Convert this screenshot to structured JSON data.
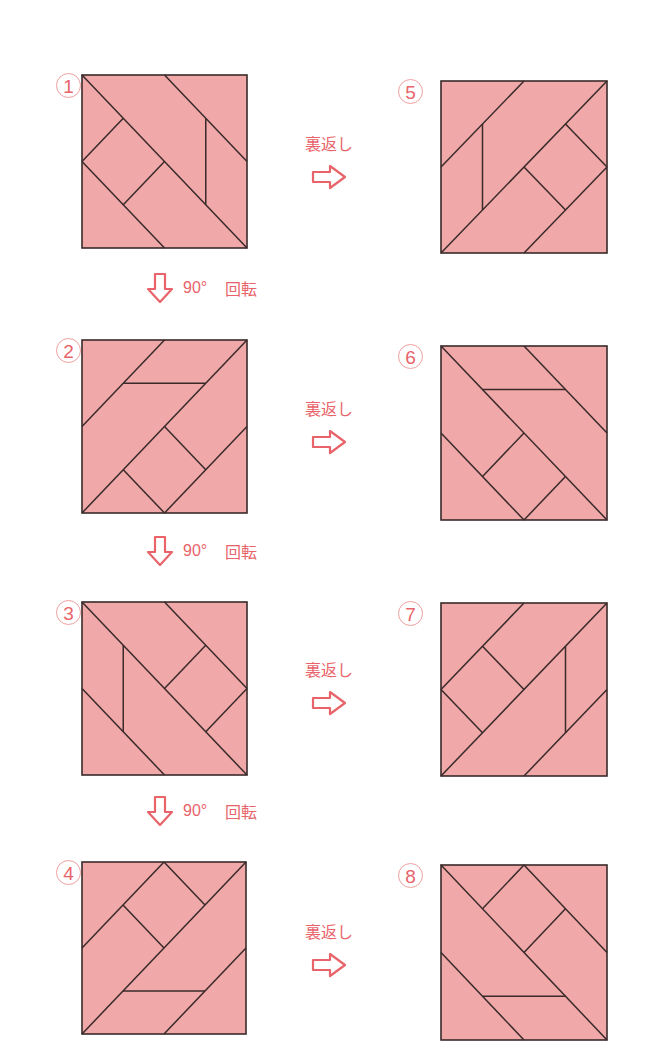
{
  "style": {
    "fill": "#f0a8a8",
    "stroke": "#3a2a2a",
    "accent": "#e8646a",
    "badge_border": "#f0a0a0"
  },
  "panels": [
    {
      "id": 1,
      "label": "1",
      "x": 82,
      "y": 75,
      "w": 165,
      "h": 173,
      "lines": [
        [
          0,
          0,
          1,
          1
        ],
        [
          0.5,
          0,
          1,
          0.5
        ],
        [
          0,
          0.5,
          0.5,
          1
        ],
        [
          0,
          0.5,
          0.25,
          0.25
        ],
        [
          0.25,
          0.75,
          0.5,
          0.5
        ],
        [
          0.75,
          0.25,
          0.75,
          0.75
        ]
      ]
    },
    {
      "id": 2,
      "label": "2",
      "x": 82,
      "y": 340,
      "w": 165,
      "h": 173,
      "lines": [
        [
          0,
          1,
          1,
          0
        ],
        [
          0,
          0.5,
          0.5,
          0
        ],
        [
          0.5,
          1,
          1,
          0.5
        ],
        [
          0.25,
          0.25,
          0.75,
          0.25
        ],
        [
          0.25,
          0.75,
          0.5,
          1
        ],
        [
          0.5,
          0.5,
          0.75,
          0.75
        ]
      ]
    },
    {
      "id": 3,
      "label": "3",
      "x": 82,
      "y": 602,
      "w": 165,
      "h": 173,
      "lines": [
        [
          0,
          0,
          1,
          1
        ],
        [
          0.5,
          0,
          1,
          0.5
        ],
        [
          0,
          0.5,
          0.5,
          1
        ],
        [
          0.75,
          0.25,
          0.5,
          0.5
        ],
        [
          1,
          0.5,
          0.75,
          0.75
        ],
        [
          0.25,
          0.25,
          0.25,
          0.75
        ]
      ]
    },
    {
      "id": 4,
      "label": "4",
      "x": 82,
      "y": 862,
      "w": 164,
      "h": 172,
      "lines": [
        [
          0,
          1,
          1,
          0
        ],
        [
          0,
          0.5,
          0.5,
          0
        ],
        [
          0.5,
          1,
          1,
          0.5
        ],
        [
          0.25,
          0.25,
          0.5,
          0.5
        ],
        [
          0.5,
          0,
          0.75,
          0.25
        ],
        [
          0.25,
          0.75,
          0.75,
          0.75
        ]
      ]
    },
    {
      "id": 5,
      "label": "5",
      "x": 441,
      "y": 81,
      "w": 166,
      "h": 172,
      "lines": [
        [
          0,
          1,
          1,
          0
        ],
        [
          0,
          0.5,
          0.5,
          0
        ],
        [
          0.5,
          1,
          1,
          0.5
        ],
        [
          0.25,
          0.25,
          0.25,
          0.75
        ],
        [
          0.75,
          0.25,
          1,
          0.5
        ],
        [
          0.5,
          0.5,
          0.75,
          0.75
        ]
      ]
    },
    {
      "id": 6,
      "label": "6",
      "x": 441,
      "y": 346,
      "w": 166,
      "h": 174,
      "lines": [
        [
          0,
          0,
          1,
          1
        ],
        [
          0.5,
          0,
          1,
          0.5
        ],
        [
          0,
          0.5,
          0.5,
          1
        ],
        [
          0.25,
          0.25,
          0.75,
          0.25
        ],
        [
          0.5,
          0.5,
          0.25,
          0.75
        ],
        [
          0.75,
          0.75,
          0.5,
          1
        ]
      ]
    },
    {
      "id": 7,
      "label": "7",
      "x": 441,
      "y": 603,
      "w": 166,
      "h": 173,
      "lines": [
        [
          0,
          1,
          1,
          0
        ],
        [
          0,
          0.5,
          0.5,
          0
        ],
        [
          0.5,
          1,
          1,
          0.5
        ],
        [
          0.25,
          0.25,
          0.5,
          0.5
        ],
        [
          0,
          0.5,
          0.25,
          0.75
        ],
        [
          0.75,
          0.25,
          0.75,
          0.75
        ]
      ]
    },
    {
      "id": 8,
      "label": "8",
      "x": 441,
      "y": 865,
      "w": 166,
      "h": 175,
      "lines": [
        [
          0,
          0,
          1,
          1
        ],
        [
          0.5,
          0,
          1,
          0.5
        ],
        [
          0,
          0.5,
          0.5,
          1
        ],
        [
          0.5,
          0,
          0.25,
          0.25
        ],
        [
          0.75,
          0.25,
          0.5,
          0.5
        ],
        [
          0.25,
          0.75,
          0.75,
          0.75
        ]
      ]
    }
  ],
  "flip_arrows": [
    {
      "label": "裏返し",
      "x": 294,
      "y": 130
    },
    {
      "label": "裏返し",
      "x": 294,
      "y": 395
    },
    {
      "label": "裏返し",
      "x": 294,
      "y": 656
    },
    {
      "label": "裏返し",
      "x": 294,
      "y": 918
    }
  ],
  "rotate_arrows": [
    {
      "degrees": "90°",
      "word": "回転",
      "x": 145,
      "y": 272
    },
    {
      "degrees": "90°",
      "word": "回転",
      "x": 145,
      "y": 535
    },
    {
      "degrees": "90°",
      "word": "回転",
      "x": 145,
      "y": 795
    }
  ]
}
